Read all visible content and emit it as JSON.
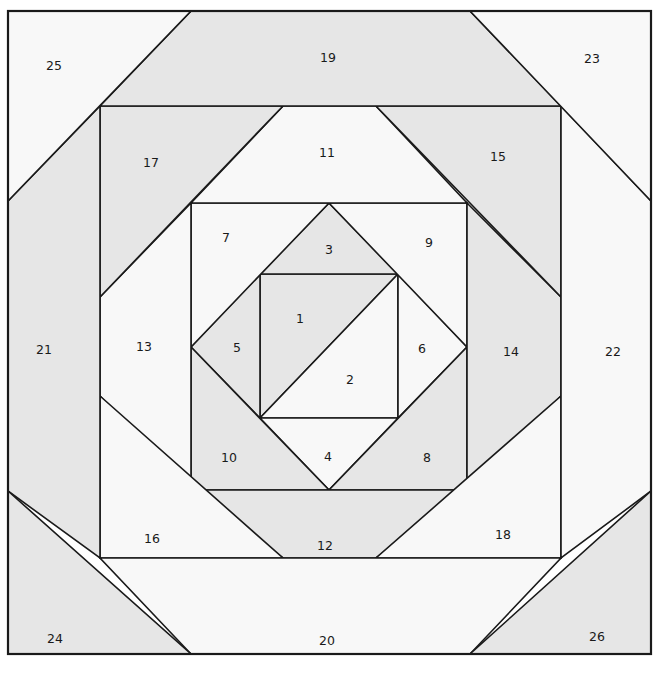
{
  "diagram": {
    "type": "quilt-block-pattern",
    "colors": {
      "gray": "#e6e6e6",
      "white": "#f8f8f8",
      "line": "#1a1a1a"
    },
    "patches": [
      {
        "label": "1",
        "shade": "gray",
        "points": "260,274 398,274 260,418",
        "lx": 300,
        "ly": 319
      },
      {
        "label": "2",
        "shade": "white",
        "points": "398,274 398,418 260,418",
        "lx": 350,
        "ly": 380
      },
      {
        "label": "3",
        "shade": "gray",
        "points": "329,203 398,274 260,274",
        "lx": 329,
        "ly": 250
      },
      {
        "label": "4",
        "shade": "white",
        "points": "260,418 398,418 329,490",
        "lx": 328,
        "ly": 457
      },
      {
        "label": "5",
        "shade": "gray",
        "points": "191,347 260,274 260,418",
        "lx": 237,
        "ly": 348
      },
      {
        "label": "6",
        "shade": "white",
        "points": "398,274 467,347 398,418",
        "lx": 422,
        "ly": 349
      },
      {
        "label": "7",
        "shade": "white",
        "points": "191,203 329,203 191,347",
        "lx": 226,
        "ly": 238
      },
      {
        "label": "8",
        "shade": "gray",
        "points": "467,347 467,490 329,490",
        "lx": 427,
        "ly": 458
      },
      {
        "label": "9",
        "shade": "white",
        "points": "329,203 467,203 467,347",
        "lx": 429,
        "ly": 243
      },
      {
        "label": "10",
        "shade": "gray",
        "points": "191,347 329,490 191,490",
        "lx": 229,
        "ly": 458
      },
      {
        "label": "11",
        "shade": "white",
        "points": "283,106 376,106 467,203 191,203",
        "lx": 327,
        "ly": 153
      },
      {
        "label": "12",
        "shade": "gray",
        "points": "191,490 467,490 376,558 283,558",
        "lx": 325,
        "ly": 546
      },
      {
        "label": "13",
        "shade": "white",
        "points": "100,297 191,203 191,490 100,396",
        "lx": 144,
        "ly": 347
      },
      {
        "label": "14",
        "shade": "gray",
        "points": "467,203 561,297 561,396 467,490",
        "lx": 511,
        "ly": 352
      },
      {
        "label": "15",
        "shade": "gray",
        "points": "376,106 561,106 561,297",
        "lx": 498,
        "ly": 157
      },
      {
        "label": "16",
        "shade": "white",
        "points": "100,396 283,558 100,558",
        "lx": 152,
        "ly": 539
      },
      {
        "label": "17",
        "shade": "gray",
        "points": "100,106 283,106 100,297",
        "lx": 151,
        "ly": 163
      },
      {
        "label": "18",
        "shade": "white",
        "points": "561,396 561,558 376,558",
        "lx": 503,
        "ly": 535
      },
      {
        "label": "19",
        "shade": "gray",
        "points": "191,11 470,11 561,106 100,106",
        "lx": 328,
        "ly": 58
      },
      {
        "label": "20",
        "shade": "white",
        "points": "100,558 561,558 470,654 191,654",
        "lx": 327,
        "ly": 641
      },
      {
        "label": "21",
        "shade": "gray",
        "points": "8,201 100,106 100,558 8,491",
        "lx": 44,
        "ly": 350
      },
      {
        "label": "22",
        "shade": "white",
        "points": "561,106 651,201 651,491 561,558",
        "lx": 613,
        "ly": 352
      },
      {
        "label": "23",
        "shade": "white",
        "points": "470,11 651,11 651,201",
        "lx": 592,
        "ly": 59
      },
      {
        "label": "24",
        "shade": "gray",
        "points": "8,491 191,654 8,654",
        "lx": 55,
        "ly": 639
      },
      {
        "label": "25",
        "shade": "white",
        "points": "8,11 191,11 8,201",
        "lx": 54,
        "ly": 66
      },
      {
        "label": "26",
        "shade": "gray",
        "points": "651,491 651,654 470,654",
        "lx": 597,
        "ly": 637
      }
    ]
  }
}
